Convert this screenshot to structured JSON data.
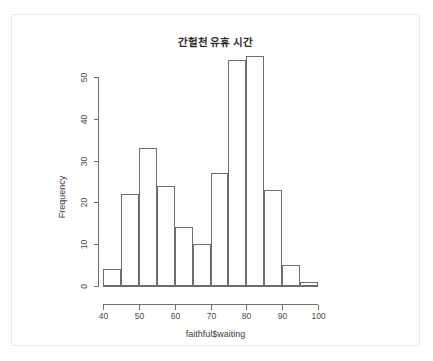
{
  "chart_data": {
    "type": "bar",
    "title": "간헐천 유휴 시간",
    "xlabel": "faithful$waiting",
    "ylabel": "Frequency",
    "categories": [
      "40-45",
      "45-50",
      "50-55",
      "55-60",
      "60-65",
      "65-70",
      "70-75",
      "75-80",
      "80-85",
      "85-90",
      "90-95",
      "95-100"
    ],
    "bin_edges": [
      40,
      45,
      50,
      55,
      60,
      65,
      70,
      75,
      80,
      85,
      90,
      95,
      100
    ],
    "values": [
      4,
      22,
      33,
      24,
      14,
      10,
      27,
      54,
      55,
      23,
      5,
      1
    ],
    "xlim": [
      40,
      100
    ],
    "ylim": [
      0,
      50
    ],
    "x_ticks": [
      40,
      50,
      60,
      70,
      80,
      90,
      100
    ],
    "x_tick_labels": [
      "40",
      "50",
      "60",
      "70",
      "80",
      "90",
      "100"
    ],
    "y_ticks": [
      0,
      10,
      20,
      30,
      40,
      50
    ],
    "y_tick_labels": [
      "0",
      "10",
      "20",
      "30",
      "40",
      "50"
    ],
    "grid": false,
    "legend": null,
    "bar_fill": "#ffffff",
    "bar_stroke": "#6e6e6e",
    "axis_color": "#6e6e6e",
    "text_color": "#3d3d3d",
    "background": "#ffffff"
  }
}
